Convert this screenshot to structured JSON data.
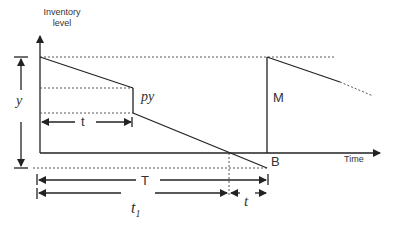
{
  "diagram": {
    "y_axis_label_line1": "Inventory",
    "y_axis_label_line2": "level",
    "x_axis_label": "Time",
    "labels": {
      "y": "y",
      "py": "py",
      "t_inner": "t",
      "M": "M",
      "B": "B",
      "T": "T",
      "t1": "t",
      "t1_sub": "1",
      "t_shortage": "t"
    },
    "colors": {
      "line": "#222222",
      "text": "#333333",
      "background": "#ffffff"
    }
  }
}
